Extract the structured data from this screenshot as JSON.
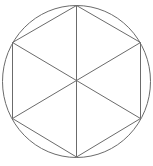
{
  "diagram": {
    "title": "",
    "stroke_color": "#6b6b6b",
    "circle": {
      "cx": 76.5,
      "cy": 81.5,
      "rx": 74,
      "ry": 76
    },
    "hexagon": {
      "vertices": [
        [
          76.5,
          5.5
        ],
        [
          140.5,
          42.5
        ],
        [
          140.5,
          118.5
        ],
        [
          76.5,
          157
        ],
        [
          12.5,
          118.5
        ],
        [
          12.5,
          42.5
        ]
      ]
    },
    "diagonals": [
      {
        "from": [
          76.5,
          5.5
        ],
        "to": [
          76.5,
          157
        ]
      },
      {
        "from": [
          12.5,
          42.5
        ],
        "to": [
          140.5,
          118.5
        ]
      },
      {
        "from": [
          140.5,
          42.5
        ],
        "to": [
          12.5,
          118.5
        ]
      }
    ]
  }
}
